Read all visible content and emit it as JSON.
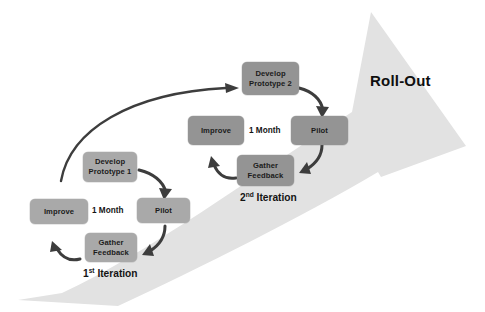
{
  "diagram": {
    "colors": {
      "background": "#ffffff",
      "big_arrow_fill": "#e2e2e2",
      "node_fill_iteration1": "#a9a9a9",
      "node_fill_iteration2": "#949494",
      "connector_arrow": "#3d3d3d",
      "text": "#161616"
    },
    "big_arrow": {
      "label": "Roll-Out",
      "direction": "bottom-left to top-right",
      "tail": [
        18,
        300
      ],
      "head_tip": [
        466,
        146
      ]
    },
    "iteration1": {
      "caption_prefix": "1",
      "caption_sup": "st",
      "caption_suffix": " Iteration",
      "duration_label": "1 Month",
      "nodes": [
        {
          "name": "develop-prototype-1",
          "line1": "Develop",
          "line2": "Prototype 1"
        },
        {
          "name": "pilot-1",
          "line1": "Pilot",
          "line2": ""
        },
        {
          "name": "gather-feedback-1",
          "line1": "Gather",
          "line2": "Feedback"
        },
        {
          "name": "improve-1",
          "line1": "Improve",
          "line2": ""
        }
      ]
    },
    "iteration2": {
      "caption_prefix": "2",
      "caption_sup": "nd",
      "caption_suffix": " Iteration",
      "duration_label": "1 Month",
      "nodes": [
        {
          "name": "develop-prototype-2",
          "line1": "Develop",
          "line2": "Prototype 2"
        },
        {
          "name": "pilot-2",
          "line1": "Pilot",
          "line2": ""
        },
        {
          "name": "gather-feedback-2",
          "line1": "Gather",
          "line2": "Feedback"
        },
        {
          "name": "improve-2",
          "line1": "Improve",
          "line2": ""
        }
      ]
    }
  }
}
